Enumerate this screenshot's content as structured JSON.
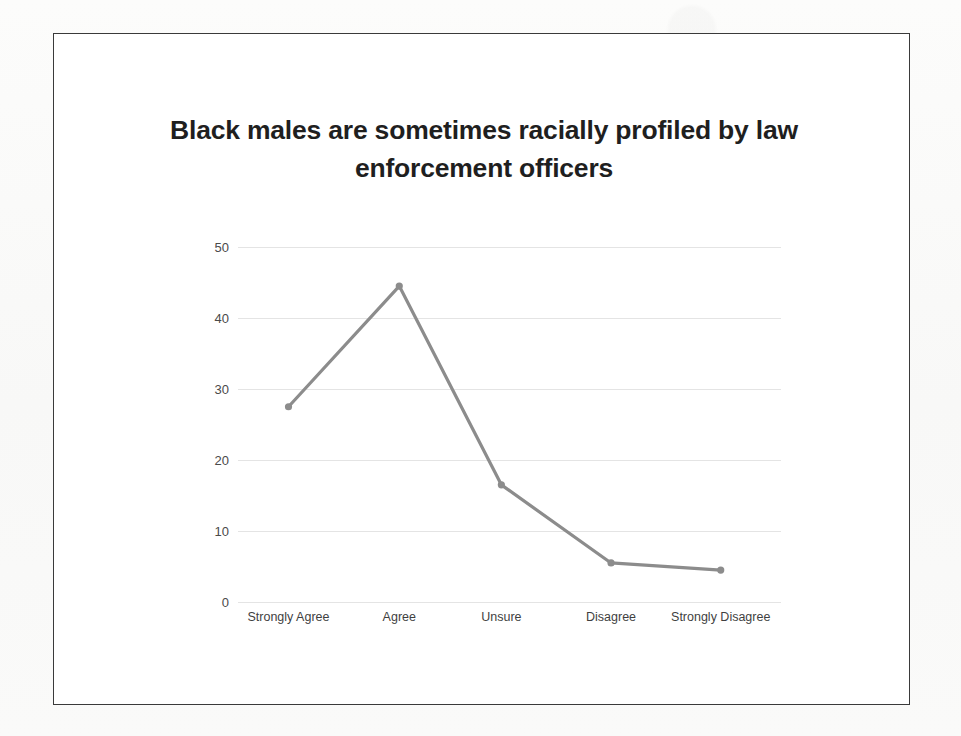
{
  "chart_data": {
    "type": "line",
    "title": "Black males are sometimes racially profiled by law enforcement officers",
    "title_line1": "Black males are sometimes racially profiled by law",
    "title_line2": "enforcement officers",
    "xlabel": "",
    "ylabel": "",
    "categories": [
      "Strongly Agree",
      "Agree",
      "Unsure",
      "Disagree",
      "Strongly Disagree"
    ],
    "values": [
      27.5,
      44.5,
      16.5,
      5.5,
      4.5
    ],
    "series": [
      {
        "name": "Responses",
        "values": [
          27.5,
          44.5,
          16.5,
          5.5,
          4.5
        ]
      }
    ],
    "ylim": [
      0,
      50
    ],
    "yticks": [
      0,
      10,
      20,
      30,
      40,
      50
    ],
    "ytick_labels": [
      "0",
      "10",
      "20",
      "30",
      "40",
      "50"
    ],
    "grid": true,
    "grid_axis": "y",
    "legend": false,
    "legend_position": "none",
    "markers": true,
    "colors": {
      "line": "#8c8c8c",
      "marker": "#8c8c8c",
      "grid": "#e4e4e4",
      "title_text": "#1f1f1f",
      "tick_text": "#4a4a4a",
      "frame_border": "#3a3a3a",
      "plot_background": "#ffffff",
      "page_background": "#fbfbfa"
    }
  }
}
